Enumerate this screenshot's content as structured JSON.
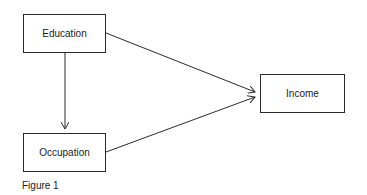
{
  "diagram": {
    "nodes": [
      {
        "id": "education",
        "label": "Education"
      },
      {
        "id": "occupation",
        "label": "Occupation"
      },
      {
        "id": "income",
        "label": "Income"
      }
    ],
    "edges": [
      {
        "from": "education",
        "to": "occupation"
      },
      {
        "from": "education",
        "to": "income"
      },
      {
        "from": "occupation",
        "to": "income"
      }
    ],
    "caption": "Figure 1"
  }
}
